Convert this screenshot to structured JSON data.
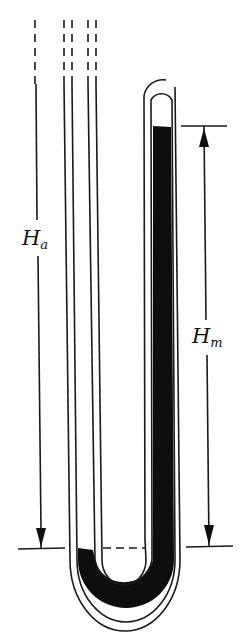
{
  "diagram": {
    "type": "u-tube-manometer",
    "labels": {
      "atmospheric_height": {
        "symbol": "H",
        "subscript": "a"
      },
      "mercury_height": {
        "symbol": "H",
        "subscript": "m"
      }
    },
    "colors": {
      "line": "#1a1a1a",
      "mercury": "#0d0d0d",
      "background": "#ffffff"
    }
  }
}
